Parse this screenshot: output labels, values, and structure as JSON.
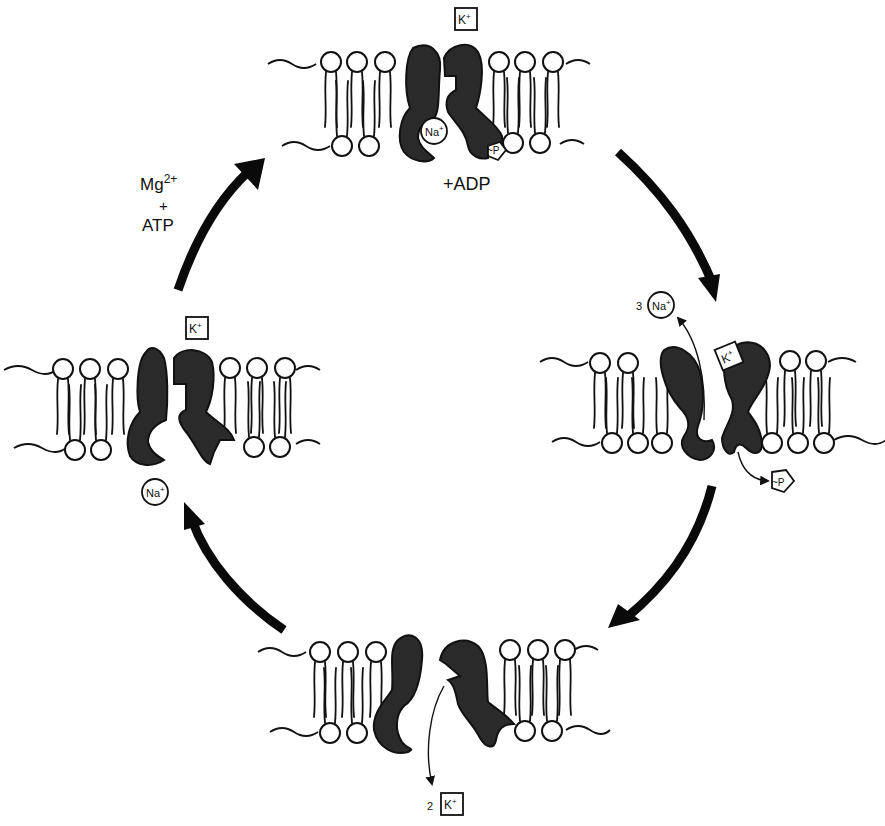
{
  "labels": {
    "cofactor_line1": "Mg",
    "cofactor_sup": "2+",
    "cofactor_plus": "+",
    "cofactor_line3": "ATP",
    "adp": "+ADP",
    "k_ion": "K",
    "na_ion": "Na",
    "plus_sup": "+",
    "phosphate": "~P",
    "na_count": "3",
    "k_count": "2"
  },
  "states": [
    {
      "id": "top",
      "ions": [
        "K+ (box, above)",
        "Na+ (bound)",
        "~P (bound)"
      ],
      "note": "+ADP"
    },
    {
      "id": "right",
      "ions": [
        "3 Na+ released",
        "K+ bound",
        "~P released"
      ]
    },
    {
      "id": "bottom",
      "ions": [
        "2 K+ released"
      ]
    },
    {
      "id": "left",
      "ions": [
        "K+ (box, above)",
        "Na+ (below)"
      ]
    }
  ],
  "colors": {
    "ink": "#111111",
    "protein": "#2a2a2a",
    "background": "#ffffff"
  }
}
